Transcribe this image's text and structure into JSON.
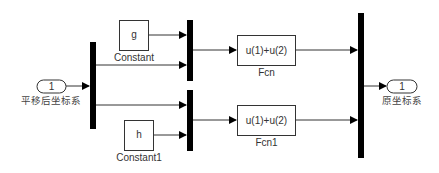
{
  "diagram": {
    "type": "simulink-block-diagram",
    "blocks": {
      "inport": {
        "number": "1",
        "label": "平移后坐标系"
      },
      "demux": {
        "label": ""
      },
      "constant": {
        "value": "g",
        "label": "Constant"
      },
      "constant1": {
        "value": "h",
        "label": "Constant1"
      },
      "mux_top": {
        "label": ""
      },
      "mux_bottom": {
        "label": ""
      },
      "fcn": {
        "expression": "u(1)+u(2)",
        "label": "Fcn"
      },
      "fcn1": {
        "expression": "u(1)+u(2)",
        "label": "Fcn1"
      },
      "mux_out": {
        "label": ""
      },
      "outport": {
        "number": "1",
        "label": "原坐标系"
      }
    },
    "connections": [
      {
        "from": "inport",
        "to": "demux"
      },
      {
        "from": "constant",
        "to": "mux_top"
      },
      {
        "from": "demux",
        "to": "mux_top"
      },
      {
        "from": "demux",
        "to": "mux_bottom"
      },
      {
        "from": "constant1",
        "to": "mux_bottom"
      },
      {
        "from": "mux_top",
        "to": "fcn"
      },
      {
        "from": "mux_bottom",
        "to": "fcn1"
      },
      {
        "from": "fcn",
        "to": "mux_out"
      },
      {
        "from": "fcn1",
        "to": "mux_out"
      },
      {
        "from": "mux_out",
        "to": "outport"
      }
    ],
    "colors": {
      "line": "#333333",
      "bar": "#000000",
      "background": "#ffffff"
    }
  }
}
